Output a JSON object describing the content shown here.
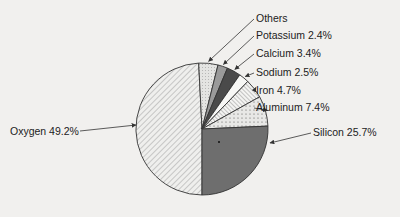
{
  "chart_data": {
    "type": "pie",
    "title": "",
    "slices": [
      {
        "label": "Oxygen",
        "value": 49.2,
        "display": "Oxygen 49.2%",
        "pattern": "diagonal-hatch"
      },
      {
        "label": "Silicon",
        "value": 25.7,
        "display": "Silicon 25.7%",
        "pattern": "dark-solid"
      },
      {
        "label": "Aluminum",
        "value": 7.4,
        "display": "Aluminum 7.4%",
        "pattern": "dots"
      },
      {
        "label": "Iron",
        "value": 4.7,
        "display": "Iron 4.7%",
        "pattern": "diagonal-hatch-dense"
      },
      {
        "label": "Sodium",
        "value": 2.5,
        "display": "Sodium 2.5%",
        "pattern": "white"
      },
      {
        "label": "Calcium",
        "value": 3.4,
        "display": "Calcium 3.4%",
        "pattern": "very-dark-solid"
      },
      {
        "label": "Potassium",
        "value": 2.4,
        "display": "Potassium 2.4%",
        "pattern": "mid-gray-solid"
      },
      {
        "label": "Others",
        "value": 4.7,
        "display": "Others",
        "pattern": "light-dots"
      }
    ],
    "legend": "callout labels with arrows",
    "start_angle_deg": 90,
    "direction": "counterclockwise from bottom (Silicon) / Oxygen on left half"
  },
  "labels": {
    "others": "Others",
    "potassium": "Potassium 2.4%",
    "calcium": "Calcium 3.4%",
    "sodium": "Sodium 2.5%",
    "iron": "Iron 4.7%",
    "aluminum": "Aluminum 7.4%",
    "silicon": "Silicon 25.7%",
    "oxygen": "Oxygen 49.2%"
  },
  "colors": {
    "background": "#f1f0ee",
    "outline": "#333333",
    "silicon": "#6e6e6e",
    "calcium": "#4a4a4a",
    "potassium": "#9a9a9a",
    "hatch": "#888888"
  }
}
